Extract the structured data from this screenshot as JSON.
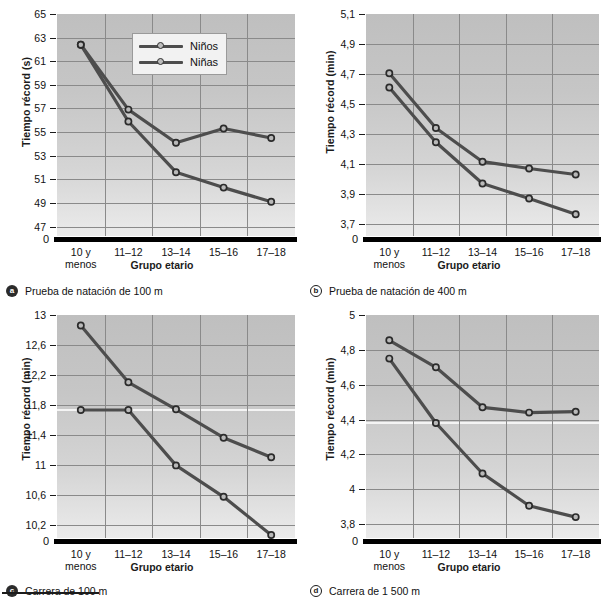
{
  "figure": {
    "legend": {
      "series1": "Niños",
      "series2": "Niñas"
    },
    "axis_x_title": "Grupo etario",
    "categories": [
      "10 y",
      "11–12",
      "13–14",
      "15–16",
      "17–18"
    ],
    "categories_line2": [
      "menos",
      "",
      "",
      "",
      ""
    ],
    "zero_label": "0"
  },
  "chart_data": [
    {
      "id": "a",
      "type": "line",
      "panel_letter": "a",
      "caption": "Prueba de natación de 100 m",
      "title": "",
      "xlabel": "Grupo etario",
      "ylabel": "Tiempo récord (s)",
      "categories": [
        "10 y menos",
        "11–12",
        "13–14",
        "15–16",
        "17–18"
      ],
      "yticks": [
        "47",
        "49",
        "51",
        "53",
        "55",
        "57",
        "59",
        "61",
        "63",
        "65"
      ],
      "ytick_values": [
        47,
        49,
        51,
        53,
        55,
        57,
        59,
        61,
        63,
        65
      ],
      "ylim": [
        46.2,
        65
      ],
      "grid": true,
      "legend_position": "upper-center",
      "series": [
        {
          "name": "Niños",
          "values": [
            62.4,
            56.9,
            54.1,
            55.3,
            54.5
          ]
        },
        {
          "name": "Niñas",
          "values": [
            62.4,
            55.9,
            51.6,
            50.3,
            49.1
          ]
        }
      ]
    },
    {
      "id": "b",
      "type": "line",
      "panel_letter": "b",
      "caption": "Prueba de natación de 400 m",
      "title": "",
      "xlabel": "Grupo etario",
      "ylabel": "Tiempo récord (min)",
      "categories": [
        "10 y menos",
        "11–12",
        "13–14",
        "15–16",
        "17–18"
      ],
      "yticks": [
        "3,7",
        "3,9",
        "4,1",
        "4,3",
        "4,5",
        "4,7",
        "4,9",
        "5,1"
      ],
      "ytick_values": [
        3.7,
        3.9,
        4.1,
        4.3,
        4.5,
        4.7,
        4.9,
        5.1
      ],
      "ylim": [
        3.62,
        5.1
      ],
      "grid": true,
      "legend_position": "none",
      "series": [
        {
          "name": "Niños",
          "values": [
            4.705,
            4.34,
            4.115,
            4.07,
            4.03
          ]
        },
        {
          "name": "Niñas",
          "values": [
            4.61,
            4.245,
            3.97,
            3.87,
            3.765
          ]
        }
      ]
    },
    {
      "id": "c",
      "type": "line",
      "panel_letter": "c",
      "caption": "Carrera de 100 m",
      "title": "",
      "xlabel": "Grupo etario",
      "ylabel": "Tiempo récord (min)",
      "categories": [
        "10 y menos",
        "11–12",
        "13–14",
        "15–16",
        "17–18"
      ],
      "yticks": [
        "10,2",
        "10,6",
        "11",
        "11,4",
        "11,8",
        "12,2",
        "12,6",
        "13"
      ],
      "ytick_values": [
        10.2,
        10.6,
        11,
        11.4,
        11.8,
        12.2,
        12.6,
        13
      ],
      "ylim": [
        10.02,
        13
      ],
      "grid": true,
      "legend_position": "none",
      "series": [
        {
          "name": "Niños",
          "values": [
            12.86,
            12.1,
            11.74,
            11.36,
            11.1
          ]
        },
        {
          "name": "Niñas",
          "values": [
            11.73,
            11.73,
            10.99,
            10.57,
            10.06
          ]
        }
      ]
    },
    {
      "id": "d",
      "type": "line",
      "panel_letter": "d",
      "caption": "Carrera de 1 500 m",
      "title": "",
      "xlabel": "Grupo etario",
      "ylabel": "Tiempo récord (min)",
      "categories": [
        "10 y menos",
        "11–12",
        "13–14",
        "15–16",
        "17–18"
      ],
      "yticks": [
        "3,8",
        "4",
        "4,2",
        "4,4",
        "4,6",
        "4,8",
        "5"
      ],
      "ytick_values": [
        3.8,
        4.0,
        4.2,
        4.4,
        4.6,
        4.8,
        5.0
      ],
      "ylim": [
        3.72,
        5.0
      ],
      "grid": true,
      "legend_position": "none",
      "series": [
        {
          "name": "Niños",
          "values": [
            4.855,
            4.7,
            4.47,
            4.44,
            4.445
          ]
        },
        {
          "name": "Niñas",
          "values": [
            4.75,
            4.38,
            4.09,
            3.905,
            3.84
          ]
        }
      ]
    }
  ],
  "colors": {
    "line": "#4d4d4d",
    "marker_fill": "#b9b9b9",
    "marker_edge": "#2b2b2b",
    "plot_bg_top": "#bfbfbf",
    "plot_bg_bottom": "#ebebeb",
    "grid": "#8a8a8a",
    "axis": "#000000",
    "text": "#111111"
  }
}
